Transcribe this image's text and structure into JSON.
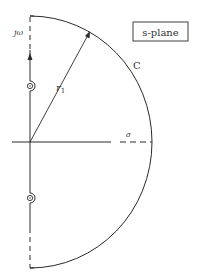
{
  "figure": {
    "plane_label": "s-plane",
    "contour_label": "C",
    "radius_label": "r",
    "radius_subscript": "1",
    "imag_axis_label": "jω",
    "real_axis_label": "σ",
    "colors": {
      "line": "#2a2a2a",
      "background": "#ffffff"
    }
  }
}
